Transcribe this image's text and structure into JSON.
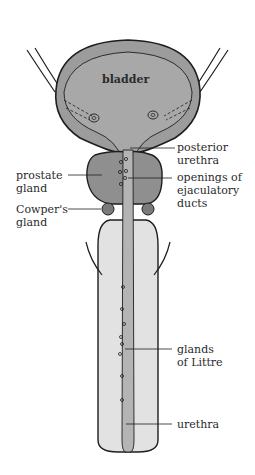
{
  "diagram": {
    "colors": {
      "outline": "#1e1e1e",
      "bladder_fill": "#9c9c9c",
      "bladder_inner": "#a8a8a8",
      "prostate_fill": "#8f8f8f",
      "urethra_fill": "#b4b4b4",
      "shaft_fill": "#e2e2e2",
      "background": "#ffffff"
    },
    "labels": {
      "bladder": "bladder",
      "posterior_urethra": [
        "posterior",
        "urethra"
      ],
      "prostate_gland": [
        "prostate",
        "gland"
      ],
      "openings_ejaculatory_ducts": [
        "openings of",
        "ejaculatory",
        "ducts"
      ],
      "cowpers_gland": [
        "Cowper's",
        "gland"
      ],
      "glands_of_littre": [
        "glands",
        "of Littre"
      ],
      "urethra": "urethra"
    }
  }
}
